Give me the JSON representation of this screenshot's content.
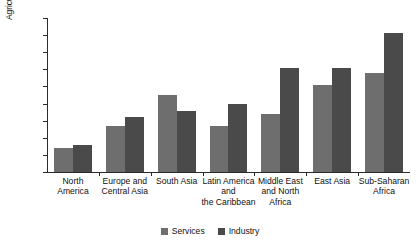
{
  "chart_data": {
    "type": "bar",
    "title": "",
    "xlabel": "",
    "ylabel": "Agriculture productivity gap",
    "ylim": [
      0,
      9
    ],
    "yticks": [
      0,
      1,
      2,
      3,
      4,
      5,
      6,
      7,
      8,
      9
    ],
    "grid": false,
    "legend_position": "bottom-center",
    "categories": [
      "North America",
      "Europe and Central Asia",
      "South Asia",
      "Latin America and the Caribbean",
      "Middle East and North Africa",
      "East Asia",
      "Sub-Saharan Africa"
    ],
    "category_label_lines": [
      [
        "North",
        "America"
      ],
      [
        "Europe and",
        "Central Asia"
      ],
      [
        "South Asia"
      ],
      [
        "Latin America",
        "and",
        "the Caribbean"
      ],
      [
        "Middle East",
        "and North",
        "Africa"
      ],
      [
        "East Asia"
      ],
      [
        "Sub-Saharan",
        "Africa"
      ]
    ],
    "series": [
      {
        "name": "Services",
        "color": "#6e6e6e",
        "values": [
          1.4,
          2.7,
          4.5,
          2.7,
          3.4,
          5.1,
          5.8
        ]
      },
      {
        "name": "Industry",
        "color": "#4a4a4a",
        "values": [
          1.6,
          3.2,
          3.55,
          4.0,
          6.1,
          6.1,
          8.1
        ]
      }
    ]
  },
  "legend": {
    "items": [
      {
        "label": "Services",
        "color": "#6e6e6e"
      },
      {
        "label": "Industry",
        "color": "#4a4a4a"
      }
    ]
  },
  "axis": {
    "y_title": "Agriculture productivity gap",
    "y_tick_labels": [
      "0",
      "1",
      "2",
      "3",
      "4",
      "5",
      "6",
      "7",
      "8",
      "9"
    ]
  }
}
